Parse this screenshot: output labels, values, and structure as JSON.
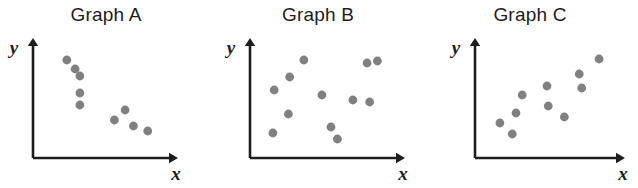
{
  "figure": {
    "background_color": "#ffffff",
    "axis_color": "#1d1d1d",
    "point_color": "#808080",
    "title_color": "#1d1d1d"
  },
  "chart_data": [
    {
      "type": "scatter",
      "title": "Graph A",
      "xlabel": "x",
      "ylabel": "y",
      "grid": false,
      "legend": "none",
      "xlim": [
        0,
        10
      ],
      "ylim": [
        0,
        10
      ],
      "relationship": "negative",
      "x": [
        2.0,
        2.7,
        3.1,
        3.1,
        3.1,
        6.0,
        6.9,
        7.6,
        8.8
      ],
      "y": [
        8.6,
        7.7,
        7.0,
        5.3,
        4.1,
        2.6,
        3.6,
        2.0,
        1.5
      ]
    },
    {
      "type": "scatter",
      "title": "Graph B",
      "xlabel": "x",
      "ylabel": "y",
      "grid": false,
      "legend": "none",
      "xlim": [
        0,
        10
      ],
      "ylim": [
        0,
        10
      ],
      "relationship": "none",
      "x": [
        1.1,
        2.3,
        2.2,
        3.4,
        4.8,
        5.5,
        7.2,
        8.3,
        8.5,
        9.1,
        1.0,
        6.0
      ],
      "y": [
        5.6,
        6.9,
        3.2,
        8.6,
        5.1,
        1.9,
        4.6,
        8.3,
        4.4,
        8.5,
        1.3,
        0.7
      ]
    },
    {
      "type": "scatter",
      "title": "Graph C",
      "xlabel": "x",
      "ylabel": "y",
      "grid": false,
      "legend": "none",
      "xlim": [
        0,
        10
      ],
      "ylim": [
        0,
        10
      ],
      "relationship": "positive",
      "x": [
        1.2,
        2.2,
        2.5,
        3.0,
        5.0,
        5.1,
        6.4,
        7.6,
        7.8,
        9.2
      ],
      "y": [
        2.3,
        1.2,
        3.3,
        5.1,
        6.0,
        4.0,
        2.9,
        7.2,
        5.8,
        8.7
      ]
    }
  ]
}
